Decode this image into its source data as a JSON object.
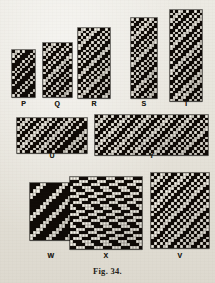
{
  "figure": {
    "caption": "Fig. 34."
  },
  "designs": [
    {
      "id": "P",
      "label": "P",
      "x": 12,
      "y": 50,
      "cell": 2.6,
      "cols": 9,
      "rows": 18,
      "label_y": 100,
      "pattern": [
        "011010001",
        "110100010",
        "101000101",
        "010001010",
        "100010100",
        "000101001",
        "001010010",
        "010100100",
        "101001000",
        "010010001",
        "100100010",
        "001000101",
        "010001010",
        "100010100",
        "000101000",
        "001010001",
        "010100010",
        "101000100"
      ]
    },
    {
      "id": "Q",
      "label": "Q",
      "x": 43,
      "y": 43,
      "cell": 2.6,
      "cols": 11,
      "rows": 21,
      "label_y": 100,
      "pattern": [
        "01011010010",
        "10110100101",
        "01101001010",
        "11010010100",
        "10100101001",
        "01001010011",
        "10010100110",
        "00101001101",
        "01010011010",
        "10100110100",
        "01001101001",
        "10011010010",
        "00110100101",
        "01101001010",
        "11010010100",
        "10100101001",
        "01001010010",
        "10010100101",
        "00101001011",
        "01010010110",
        "10100101100"
      ]
    },
    {
      "id": "R",
      "label": "R",
      "x": 78,
      "y": 28,
      "cell": 2.7,
      "cols": 12,
      "rows": 26,
      "label_y": 100,
      "pattern": [
        "011010110010",
        "110101100101",
        "101011001010",
        "010110010101",
        "101100101010",
        "011001010100",
        "110010101001",
        "100101010011",
        "001010100110",
        "010101001100",
        "101010011001",
        "010100110010",
        "101001100101",
        "010011001010",
        "100110010101",
        "001100101011",
        "011001010110",
        "110010101100",
        "100101011001",
        "001010110010",
        "010101100101",
        "101011001010",
        "010110010100",
        "101100101001",
        "011001010011",
        "110010100110"
      ]
    },
    {
      "id": "S",
      "label": "S",
      "x": 131,
      "y": 18,
      "cell": 2.6,
      "cols": 10,
      "rows": 31,
      "label_y": 100,
      "pattern": [
        "1010010110",
        "0100101101",
        "1001011010",
        "0010110100",
        "0101101001",
        "1011010010",
        "0110100101",
        "1101001010",
        "1010010101",
        "0100101011",
        "1001010110",
        "0010101100",
        "0101011001",
        "1010110010",
        "0101100101",
        "1011001010",
        "0110010101",
        "1100101010",
        "1001010100",
        "0010101001",
        "0101010011",
        "1010100110",
        "0101001101",
        "1010011010",
        "0100110100",
        "1001101001",
        "0011010010",
        "0110100101",
        "1101001011",
        "1010010110",
        "0100101100"
      ]
    },
    {
      "id": "T",
      "label": "T",
      "x": 170,
      "y": 10,
      "cell": 2.7,
      "cols": 12,
      "rows": 34,
      "label_y": 100,
      "pattern": [
        "010110100101",
        "101101001010",
        "011010010101",
        "110100101011",
        "101001010110",
        "010010101100",
        "100101011001",
        "001010110010",
        "010101100101",
        "101011001010",
        "010110010100",
        "101100101001",
        "011001010011",
        "110010100110",
        "100101001101",
        "001010011010",
        "010100110100",
        "101001101001",
        "010011010010",
        "100110100101",
        "001101001010",
        "011010010100",
        "110100101001",
        "101001010011",
        "010010100110",
        "100101001101",
        "001010011011",
        "010100110110",
        "101001101100",
        "010011011001",
        "100110110010",
        "001101100101",
        "011011001010",
        "110110010101"
      ]
    },
    {
      "id": "U",
      "label": "U",
      "x": 17,
      "y": 118,
      "cell": 2.7,
      "cols": 26,
      "rows": 13,
      "label_y": 152,
      "pattern": [
        "01011010010110100101101001",
        "10110100101101001011010010",
        "01101001011010010110100100",
        "11010010110100101101001000",
        "10100101101001011010010001",
        "01001011010010110100100011",
        "10010110100101101001000110",
        "00101101001011010010001101",
        "01011010010110100100011010",
        "10110100101101001000110100",
        "01101001011010010001101001",
        "11010010110100100011010011",
        "10100101101001000110100110"
      ]
    },
    {
      "id": "Y",
      "label": "Y",
      "x": 95,
      "y": 115,
      "cell": 2.7,
      "cols": 42,
      "rows": 15,
      "label_y": 152,
      "pattern": [
        "010110100101101001011010010110100101101001",
        "101101001011010010110100101101001011010010",
        "011010010110100101101001011010010110100101",
        "110100101101001011010010110100101101001010",
        "101001011010010110100101101001011010010101",
        "010010110100101101001011010010110100101011",
        "100101101001011010010110100101101001010110",
        "001011010010110100101101001011010010101100",
        "010110100101101001011010010110100101011001",
        "101101001011010010110100101101001010110010",
        "011010010110100101101001011010010101100101",
        "110100101101001011010010110100101011001010",
        "101001011010010110100101101001010110010101",
        "010010110100101101001011010010101100101010",
        "100101101001011010010110100101011001010100"
      ]
    },
    {
      "id": "W",
      "label": "W",
      "x": 30,
      "y": 183,
      "cell": 3.2,
      "cols": 13,
      "rows": 18,
      "label_y": 252,
      "pattern": [
        "0001100000110",
        "0011000001100",
        "0110000011000",
        "1100000110000",
        "1000001100001",
        "0000011000011",
        "0000110000110",
        "0001100001100",
        "0011000011000",
        "0110000110000",
        "1100001100001",
        "1000011000011",
        "0000110000110",
        "0001100001100",
        "0011000011000",
        "0110000110000",
        "1100001100001",
        "1000011000011"
      ]
    },
    {
      "id": "X",
      "label": "X",
      "x": 70,
      "y": 177,
      "cell": 3.0,
      "cols": 24,
      "rows": 24,
      "label_y": 252,
      "pattern": [
        "111000111000111000111000",
        "000111000111000111000111",
        "011100011100011100011100",
        "100011100011100011100011",
        "110001110001110001110001",
        "001110001110001110001110",
        "111000111000111000111000",
        "000111000111000111000111",
        "011100011100011100011100",
        "100011100011100011100011",
        "110001110001110001110001",
        "001110001110001110001110",
        "111000111000111000111000",
        "000111000111000111000111",
        "011100011100011100011100",
        "100011100011100011100011",
        "110001110001110001110001",
        "001110001110001110001110",
        "111000111000111000111000",
        "000111000111000111000111",
        "011100011100011100011100",
        "100011100011100011100011",
        "110001110001110001110001",
        "001110001110001110001110"
      ]
    },
    {
      "id": "V",
      "label": "V",
      "x": 151,
      "y": 173,
      "cell": 2.9,
      "cols": 20,
      "rows": 26,
      "label_y": 252,
      "pattern": [
        "01011010010110100101",
        "10110100101101001010",
        "01101001011010010101",
        "11010010110100101011",
        "10100101101001010110",
        "01001011010010101100",
        "10010110100101011001",
        "00101101001010110010",
        "01011010010101100101",
        "10110100101011001010",
        "01101001010110010101",
        "11010010101100101011",
        "10100101011001010110",
        "01001010110010101100",
        "10010101100101011001",
        "00101011001010110010",
        "01010110010101100101",
        "10101100101011001010",
        "01011001010110010101",
        "10110010101100101011",
        "01100101011001010110",
        "11001010110010101100",
        "10010101100101011001",
        "00101011001010110010",
        "01010110010101100101",
        "10101100101011001010"
      ]
    }
  ]
}
